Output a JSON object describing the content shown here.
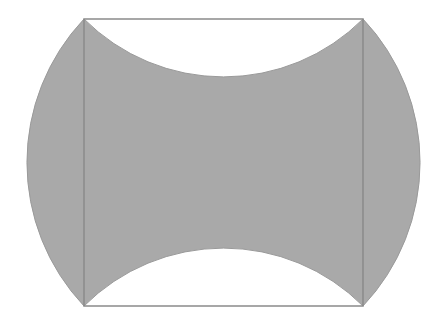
{
  "diagram": {
    "width": 439,
    "height": 328,
    "colors": {
      "background": "#ffffff",
      "shaded_fill": "#a9a9a9",
      "square_stroke": "#8a8a8a",
      "arc_stroke": "#9a9a9a"
    },
    "square": {
      "top_left": [
        84,
        19
      ],
      "top_right": [
        363,
        19
      ],
      "bottom_right": [
        363,
        306
      ],
      "bottom_left": [
        84,
        306
      ]
    },
    "arcs": {
      "left": {
        "type": "convex-outward",
        "radius": 209,
        "extreme_x": 27
      },
      "right": {
        "type": "convex-outward",
        "radius": 209,
        "extreme_x": 420
      },
      "top": {
        "type": "concave-inward",
        "radius": 197,
        "extreme_y": 77
      },
      "bottom": {
        "type": "concave-inward",
        "radius": 197,
        "extreme_y": 250
      }
    },
    "description": "Square with shaded region bounded by two outward-bulging circular arcs on the left and right sides and two inward-curving circular arcs on the top and bottom sides"
  }
}
